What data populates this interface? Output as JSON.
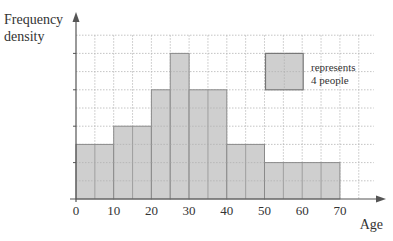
{
  "chart_data": {
    "type": "bar",
    "subtype": "histogram",
    "title": "",
    "xlabel": "Age",
    "ylabel": "Frequency density",
    "x_ticks": [
      0,
      10,
      20,
      30,
      40,
      50,
      60,
      70
    ],
    "xlim": [
      0,
      75
    ],
    "ylim_grid_units": [
      0,
      9
    ],
    "y_tick_labels": [],
    "grid": true,
    "bins": [
      {
        "from": 0,
        "to": 10,
        "height_units": 3
      },
      {
        "from": 10,
        "to": 20,
        "height_units": 4
      },
      {
        "from": 20,
        "to": 25,
        "height_units": 6
      },
      {
        "from": 25,
        "to": 30,
        "height_units": 8
      },
      {
        "from": 30,
        "to": 40,
        "height_units": 6
      },
      {
        "from": 40,
        "to": 50,
        "height_units": 3
      },
      {
        "from": 50,
        "to": 70,
        "height_units": 2
      }
    ],
    "key": {
      "width_x_units": 10,
      "height_units": 2,
      "x_start": 50,
      "y_top_units": 8,
      "label_line1": "represents",
      "label_line2": "4 people"
    },
    "colors": {
      "bar_fill": "#cfcfcf",
      "bar_stroke": "#8a8a8a",
      "grid": "#b5b5b5",
      "axis": "#555555"
    }
  },
  "labels": {
    "ylabel_line1": "Frequency",
    "ylabel_line2": "density",
    "xlabel": "Age",
    "key_line1": "represents",
    "key_line2": "4 people"
  }
}
